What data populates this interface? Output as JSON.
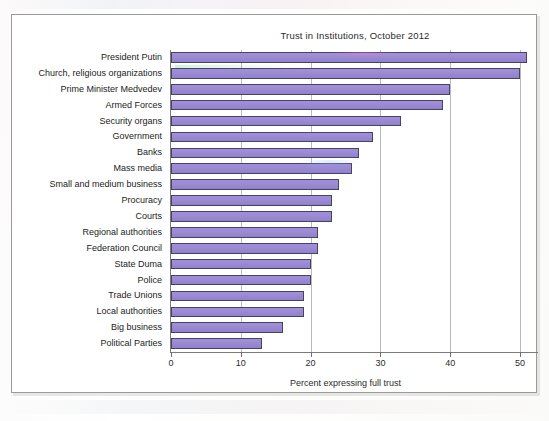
{
  "chart_data": {
    "type": "bar",
    "orientation": "horizontal",
    "title": "Trust in Institutions, October 2012",
    "xlabel": "Percent expressing full trust",
    "ylabel": "",
    "xlim": [
      0,
      50
    ],
    "xticks": [
      0,
      10,
      20,
      30,
      40,
      50
    ],
    "grid": true,
    "legend": "none",
    "bar_color": "#9b8ad6",
    "bar_edge_color": "#4a4458",
    "categories": [
      "President Putin",
      "Church, religious organizations",
      "Prime Minister Medvedev",
      "Armed Forces",
      "Security organs",
      "Government",
      "Banks",
      "Mass media",
      "Small and medium business",
      "Procuracy",
      "Courts",
      "Regional authorities",
      "Federation Council",
      "State Duma",
      "Police",
      "Trade Unions",
      "Local authorities",
      "Big business",
      "Political Parties"
    ],
    "values": [
      51,
      50,
      40,
      39,
      33,
      29,
      27,
      26,
      24,
      23,
      23,
      21,
      21,
      20,
      20,
      19,
      19,
      16,
      13
    ]
  },
  "axis": {
    "tick_labels": [
      "0",
      "10",
      "20",
      "30",
      "40",
      "50"
    ],
    "x_axis_title": "Percent expressing full trust"
  },
  "header": {
    "title": "Trust in Institutions, October 2012"
  }
}
